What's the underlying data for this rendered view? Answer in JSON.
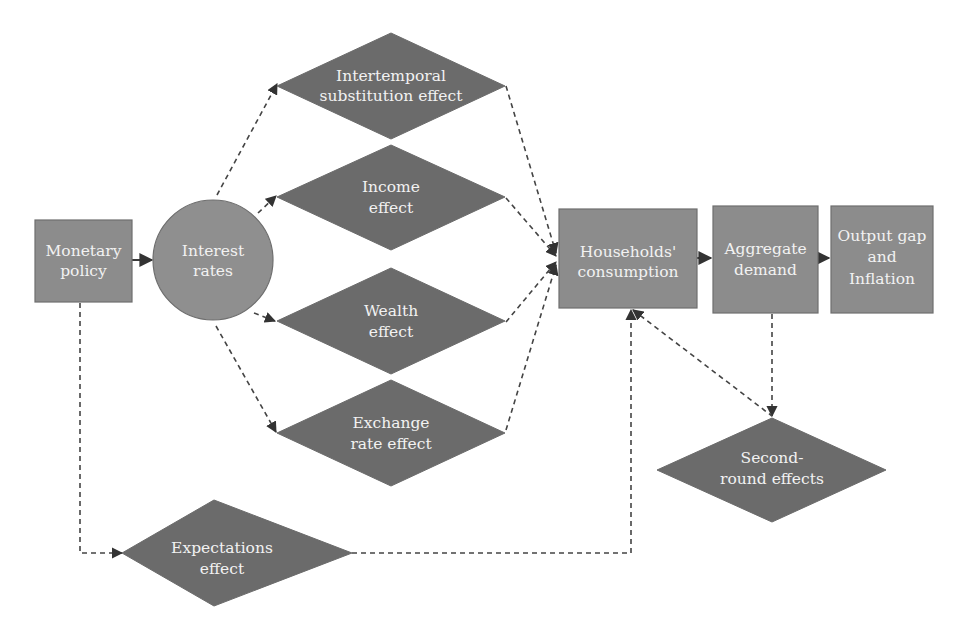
{
  "diagram": {
    "colors": {
      "box_fill": "#8c8c8c",
      "circle_fill": "#8f8f8f",
      "diamond_fill": "#6b6b6b",
      "text": "#f2f2f2",
      "edge": "#444444",
      "background": "#ffffff"
    },
    "nodes": {
      "monetary_policy": {
        "shape": "rectangle",
        "line1": "Monetary",
        "line2": "policy"
      },
      "interest_rates": {
        "shape": "circle",
        "line1": "Interest",
        "line2": "rates"
      },
      "intertemporal": {
        "shape": "diamond",
        "line1": "Intertemporal",
        "line2": "substitution effect"
      },
      "income": {
        "shape": "diamond",
        "line1": "Income",
        "line2": "effect"
      },
      "wealth": {
        "shape": "diamond",
        "line1": "Wealth",
        "line2": "effect"
      },
      "exchange_rate": {
        "shape": "diamond",
        "line1": "Exchange",
        "line2": "rate effect"
      },
      "households_consumption": {
        "shape": "rectangle",
        "line1": "Households'",
        "line2": "consumption"
      },
      "aggregate_demand": {
        "shape": "rectangle",
        "line1": "Aggregate",
        "line2": "demand"
      },
      "output_gap": {
        "shape": "rectangle",
        "line1": "Output gap",
        "line2": "and",
        "line3": "Inflation"
      },
      "second_round": {
        "shape": "diamond",
        "line1": "Second-",
        "line2": "round effects"
      },
      "expectations": {
        "shape": "diamond",
        "line1": "Expectations",
        "line2": "effect"
      }
    },
    "edges": [
      {
        "from": "Monetary policy",
        "to": "Interest rates",
        "style": "solid"
      },
      {
        "from": "Interest rates",
        "to": "Intertemporal substitution effect",
        "style": "dashed"
      },
      {
        "from": "Interest rates",
        "to": "Income effect",
        "style": "dashed"
      },
      {
        "from": "Interest rates",
        "to": "Wealth effect",
        "style": "dashed"
      },
      {
        "from": "Interest rates",
        "to": "Exchange rate effect",
        "style": "dashed"
      },
      {
        "from": "Intertemporal substitution effect",
        "to": "Households' consumption",
        "style": "dashed"
      },
      {
        "from": "Income effect",
        "to": "Households' consumption",
        "style": "dashed"
      },
      {
        "from": "Wealth effect",
        "to": "Households' consumption",
        "style": "dashed"
      },
      {
        "from": "Exchange rate effect",
        "to": "Households' consumption",
        "style": "dashed"
      },
      {
        "from": "Households' consumption",
        "to": "Aggregate demand",
        "style": "solid"
      },
      {
        "from": "Aggregate demand",
        "to": "Output gap and Inflation",
        "style": "solid"
      },
      {
        "from": "Aggregate demand",
        "to": "Second-round effects",
        "style": "dashed"
      },
      {
        "from": "Households' consumption",
        "to": "Second-round effects",
        "style": "dashed-bidirectional"
      },
      {
        "from": "Monetary policy",
        "to": "Expectations effect",
        "style": "dashed"
      },
      {
        "from": "Expectations effect",
        "to": "Households' consumption",
        "style": "dashed"
      }
    ]
  }
}
